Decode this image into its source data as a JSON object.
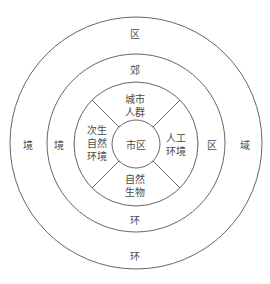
{
  "diagram": {
    "type": "concentric-circles",
    "center": "市区",
    "inner_ring_sectors": {
      "top": [
        "城市",
        "人群"
      ],
      "left": [
        "次生",
        "自然",
        "环境"
      ],
      "right": [
        "人工",
        "环境"
      ],
      "bottom": [
        "自然",
        "生物"
      ]
    },
    "middle_ring": {
      "top": "郊",
      "left": "境",
      "right": "区",
      "bottom": "环"
    },
    "outer_ring": {
      "top": "区",
      "left": "境",
      "right": "域",
      "bottom": "环"
    },
    "colors": {
      "line": "#555555",
      "text": "#4a4a4a",
      "background": "#ffffff"
    }
  }
}
